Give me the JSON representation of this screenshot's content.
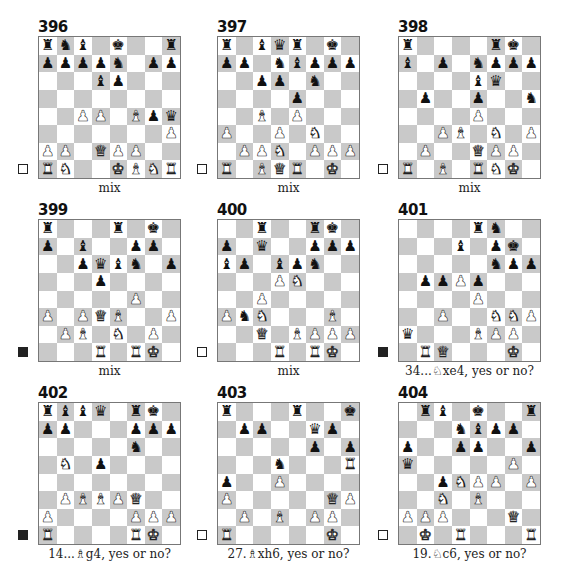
{
  "page": {
    "diagrams": [
      {
        "number": "396",
        "to_move": "white",
        "caption": "mix",
        "board": [
          "rnb.k..r",
          "ppppn.pp",
          "...bp...",
          "........",
          "..PP.Bpq",
          ".......P",
          "PP.QPP..",
          "RN..KBNR"
        ]
      },
      {
        "number": "397",
        "to_move": "white",
        "caption": "mix",
        "board": [
          "r.bqr.k.",
          "pp.nbppp",
          "..pp.n..",
          "....p...",
          "..B.P...",
          "P..P.N..",
          ".PPN.PPP",
          "R.BQR.K."
        ]
      },
      {
        "number": "398",
        "to_move": "white",
        "caption": "mix",
        "board": [
          "r....rk.",
          "b.p.nppp",
          "....bq..",
          ".p..p..n",
          "....P...",
          "..PB.N.P",
          ".P..QPP.",
          "R.B.RNK."
        ]
      },
      {
        "number": "399",
        "to_move": "black",
        "caption": "mix",
        "board": [
          "r...r.k.",
          "p.b..pp.",
          "..pqbn.p",
          "...p....",
          ".....P..",
          "P.PQB..P",
          ".PB.N.P.",
          "...R.RK."
        ]
      },
      {
        "number": "400",
        "to_move": "white",
        "caption": "mix",
        "board": [
          "..r..rk.",
          "p.q..ppp",
          "bp.bpn..",
          "...PN...",
          "..P.....",
          "PnN...B.",
          "..Q.BPPP",
          "...R.RK."
        ]
      },
      {
        "number": "401",
        "to_move": "black",
        "caption": "34...♘xe4, yes or no?",
        "board": [
          "....rn..",
          "...b.pk.",
          ".....npp",
          ".ppPp...",
          "....P...",
          "..P..NNP",
          "q...BPP.",
          ".RQ...K."
        ]
      },
      {
        "number": "402",
        "to_move": "black",
        "caption": "14...♗g4, yes or no?",
        "board": [
          "rbbq.rk.",
          "pp...ppp",
          ".....n..",
          ".N.p....",
          "........",
          ".PBBPQ..",
          "P....PPP",
          "R....RK."
        ]
      },
      {
        "number": "403",
        "to_move": "white",
        "caption": "27.♗xh6, yes or no?",
        "board": [
          "r...r..k",
          ".pp..qp.",
          ".....p.p",
          "...n...R",
          "p..P....",
          "P.....QP",
          ".P.B.PP.",
          "R.....K."
        ]
      },
      {
        "number": "404",
        "to_move": "white",
        "caption": "19.♘c6, yes or no?",
        "board": [
          ".rb.k..r",
          "...nbpp.",
          "p..pp..p",
          "q.....P.",
          "..pNPP.P",
          "..N.B...",
          "PPP...Q.",
          ".K.R...R"
        ]
      }
    ],
    "piece_glyphs": {
      "K": "♚",
      "Q": "♛",
      "R": "♜",
      "B": "♝",
      "N": "♞",
      "P": "♟",
      "k": "♚",
      "q": "♛",
      "r": "♜",
      "b": "♝",
      "n": "♞",
      "p": "♟"
    },
    "colors": {
      "light_square": "#ffffff",
      "dark_square": "#c9c9c9"
    }
  }
}
